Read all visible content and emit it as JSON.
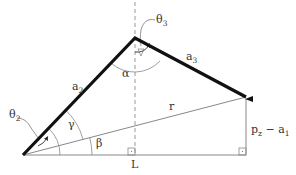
{
  "diagram": {
    "colors": {
      "link": "#111111",
      "thin_line": "#888888",
      "dashed": "#999999",
      "text": "#333333",
      "background": "#ffffff"
    },
    "points": {
      "base": [
        23,
        155
      ],
      "elbow": [
        135,
        38
      ],
      "end_effector": [
        246,
        97
      ],
      "ground_corner": [
        246,
        155
      ],
      "L_foot": [
        135,
        155
      ]
    },
    "labels": {
      "a2": {
        "main": "a",
        "sub": "2"
      },
      "a3": {
        "main": "a",
        "sub": "3"
      },
      "theta2": {
        "main": "θ",
        "sub": "2"
      },
      "theta3": {
        "main": "θ",
        "sub": "3"
      },
      "alpha": "α",
      "gamma": "γ",
      "beta": "β",
      "r": "r",
      "L": "L",
      "pz_a1": {
        "p": "p",
        "psub": "z",
        "minus": " − ",
        "a": "a",
        "asub": "1"
      }
    }
  }
}
